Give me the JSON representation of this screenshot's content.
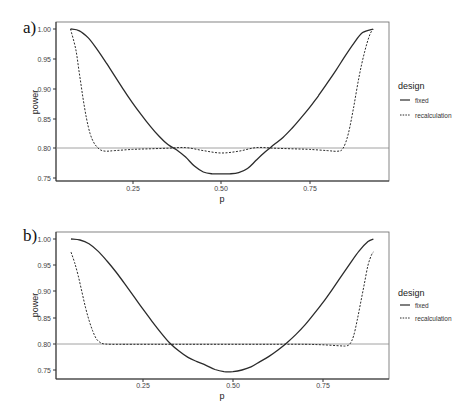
{
  "chart_data": [
    {
      "panel": "a)",
      "type": "line",
      "xlabel": "p",
      "ylabel": "power",
      "xlim": [
        0.05,
        0.97
      ],
      "ylim": [
        0.745,
        1.01
      ],
      "xticks": [
        "0.25",
        "0.50",
        "0.75"
      ],
      "yticks": [
        "0.75",
        "0.80",
        "0.85",
        "0.90",
        "0.95",
        "1.00"
      ],
      "grid": false,
      "reference_line": 0.8,
      "legend": {
        "title": "design",
        "position": "right",
        "entries": [
          "fixed",
          "recalculation"
        ]
      },
      "series": [
        {
          "name": "fixed",
          "style": "solid",
          "x": [
            0.075,
            0.1,
            0.125,
            0.15,
            0.175,
            0.2,
            0.225,
            0.25,
            0.275,
            0.3,
            0.325,
            0.35,
            0.375,
            0.4,
            0.425,
            0.45,
            0.475,
            0.5,
            0.525,
            0.55,
            0.575,
            0.6,
            0.625,
            0.65,
            0.675,
            0.7,
            0.725,
            0.75,
            0.775,
            0.8,
            0.825,
            0.85,
            0.875,
            0.9,
            0.93
          ],
          "y": [
            1.0,
            0.997,
            0.985,
            0.966,
            0.944,
            0.921,
            0.898,
            0.876,
            0.856,
            0.837,
            0.82,
            0.806,
            0.797,
            0.785,
            0.77,
            0.76,
            0.757,
            0.757,
            0.757,
            0.759,
            0.766,
            0.78,
            0.794,
            0.806,
            0.818,
            0.833,
            0.85,
            0.868,
            0.888,
            0.909,
            0.931,
            0.954,
            0.976,
            0.994,
            1.0
          ]
        },
        {
          "name": "recalculation",
          "style": "dashed",
          "x": [
            0.075,
            0.09,
            0.1,
            0.11,
            0.12,
            0.13,
            0.14,
            0.15,
            0.16,
            0.175,
            0.2,
            0.25,
            0.3,
            0.35,
            0.4,
            0.45,
            0.5,
            0.55,
            0.6,
            0.65,
            0.7,
            0.75,
            0.8,
            0.83,
            0.845,
            0.86,
            0.875,
            0.89,
            0.905,
            0.92,
            0.93
          ],
          "y": [
            1.0,
            0.965,
            0.925,
            0.885,
            0.85,
            0.825,
            0.81,
            0.802,
            0.797,
            0.795,
            0.796,
            0.798,
            0.799,
            0.8,
            0.801,
            0.796,
            0.792,
            0.795,
            0.801,
            0.8,
            0.799,
            0.798,
            0.796,
            0.795,
            0.8,
            0.825,
            0.87,
            0.92,
            0.96,
            0.99,
            1.0
          ]
        }
      ]
    },
    {
      "panel": "b)",
      "type": "line",
      "xlabel": "p",
      "ylabel": "power",
      "xlim": [
        0.01,
        0.93
      ],
      "ylim": [
        0.733,
        1.013
      ],
      "xticks": [
        "0.25",
        "0.50",
        "0.75"
      ],
      "yticks": [
        "0.75",
        "0.80",
        "0.85",
        "0.90",
        "0.95",
        "1.00"
      ],
      "grid": false,
      "reference_line": 0.8,
      "legend": {
        "title": "design",
        "position": "right",
        "entries": [
          "fixed",
          "recalculation"
        ]
      },
      "series": [
        {
          "name": "fixed",
          "style": "solid",
          "x": [
            0.05,
            0.075,
            0.1,
            0.125,
            0.15,
            0.175,
            0.2,
            0.225,
            0.25,
            0.275,
            0.3,
            0.325,
            0.35,
            0.375,
            0.4,
            0.425,
            0.45,
            0.475,
            0.5,
            0.525,
            0.55,
            0.575,
            0.6,
            0.625,
            0.65,
            0.675,
            0.7,
            0.725,
            0.75,
            0.775,
            0.8,
            0.825,
            0.85,
            0.875,
            0.89
          ],
          "y": [
            1.0,
            0.998,
            0.991,
            0.977,
            0.958,
            0.937,
            0.914,
            0.89,
            0.866,
            0.843,
            0.821,
            0.801,
            0.786,
            0.774,
            0.766,
            0.759,
            0.751,
            0.747,
            0.747,
            0.75,
            0.756,
            0.766,
            0.776,
            0.788,
            0.802,
            0.818,
            0.836,
            0.857,
            0.879,
            0.903,
            0.928,
            0.953,
            0.977,
            0.995,
            1.0
          ]
        },
        {
          "name": "recalculation",
          "style": "dashed",
          "x": [
            0.05,
            0.06,
            0.07,
            0.08,
            0.09,
            0.1,
            0.11,
            0.12,
            0.13,
            0.14,
            0.16,
            0.2,
            0.3,
            0.4,
            0.5,
            0.6,
            0.7,
            0.75,
            0.8,
            0.815,
            0.825,
            0.835,
            0.845,
            0.855,
            0.865,
            0.875,
            0.885,
            0.89
          ],
          "y": [
            0.975,
            0.955,
            0.93,
            0.9,
            0.87,
            0.845,
            0.825,
            0.81,
            0.803,
            0.8,
            0.799,
            0.799,
            0.799,
            0.799,
            0.799,
            0.799,
            0.799,
            0.798,
            0.796,
            0.796,
            0.8,
            0.815,
            0.845,
            0.88,
            0.915,
            0.95,
            0.97,
            0.975
          ]
        }
      ]
    }
  ],
  "panels": [
    {
      "label": "a)",
      "xlabel": "p",
      "ylabel": "power",
      "xticks": [
        "0.25",
        "0.50",
        "0.75"
      ],
      "yticks": [
        "1.00",
        "0.95",
        "0.90",
        "0.85",
        "0.80",
        "0.75"
      ],
      "legend_title": "design",
      "legend_fixed": "fixed",
      "legend_recalc": "recalculation"
    },
    {
      "label": "b)",
      "xlabel": "p",
      "ylabel": "power",
      "xticks": [
        "0.25",
        "0.50",
        "0.75"
      ],
      "yticks": [
        "1.00",
        "0.95",
        "0.90",
        "0.85",
        "0.80",
        "0.75"
      ],
      "legend_title": "design",
      "legend_fixed": "fixed",
      "legend_recalc": "recalculation"
    }
  ],
  "colors": {
    "line": "#2b2b2b",
    "axis": "#555555",
    "refline": "#8a8a8a"
  }
}
